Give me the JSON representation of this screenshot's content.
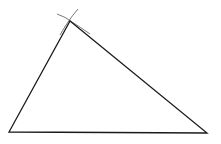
{
  "diagram": {
    "type": "geometric-construction",
    "stroke_color": "#1a1a1a",
    "arc_color": "#555555",
    "background": "#ffffff",
    "vertices": {
      "A": {
        "x": 9,
        "y": 132
      },
      "B": {
        "x": 207,
        "y": 133
      },
      "C": {
        "x": 70,
        "y": 21
      }
    },
    "arcs": [
      {
        "name": "arc-from-B",
        "path": "M57 14 Q66 17 72 22 Q80 27 90 34"
      },
      {
        "name": "arc-from-A",
        "path": "M78 9 Q72 16 68 22 Q64 28 60 35"
      }
    ]
  }
}
